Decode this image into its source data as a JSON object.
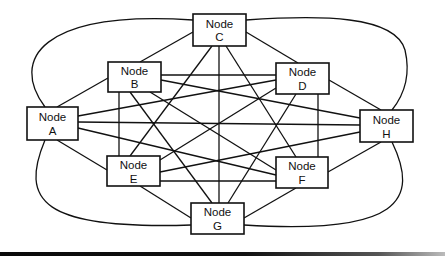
{
  "diagram": {
    "type": "fully-connected-graph",
    "nodes": [
      {
        "id": "A",
        "line1": "Node",
        "line2": "A",
        "x": 27,
        "y": 107,
        "w": 51,
        "h": 33
      },
      {
        "id": "B",
        "line1": "Node",
        "line2": "B",
        "x": 108,
        "y": 62,
        "w": 53,
        "h": 30
      },
      {
        "id": "C",
        "line1": "Node",
        "line2": "C",
        "x": 193,
        "y": 14,
        "w": 53,
        "h": 32
      },
      {
        "id": "D",
        "line1": "Node",
        "line2": "D",
        "x": 276,
        "y": 63,
        "w": 53,
        "h": 31
      },
      {
        "id": "H",
        "line1": "Node",
        "line2": "H",
        "x": 360,
        "y": 110,
        "w": 53,
        "h": 32
      },
      {
        "id": "E",
        "line1": "Node",
        "line2": "E",
        "x": 107,
        "y": 156,
        "w": 53,
        "h": 30
      },
      {
        "id": "F",
        "line1": "Node",
        "line2": "F",
        "x": 276,
        "y": 157,
        "w": 52,
        "h": 31
      },
      {
        "id": "G",
        "line1": "Node",
        "line2": "G",
        "x": 191,
        "y": 203,
        "w": 53,
        "h": 31
      }
    ],
    "edges": [
      [
        "A",
        "B"
      ],
      [
        "A",
        "E"
      ],
      [
        "A",
        "D"
      ],
      [
        "A",
        "H"
      ],
      [
        "A",
        "F"
      ],
      [
        "B",
        "C"
      ],
      [
        "B",
        "D"
      ],
      [
        "B",
        "H"
      ],
      [
        "B",
        "E"
      ],
      [
        "B",
        "G"
      ],
      [
        "B",
        "F"
      ],
      [
        "C",
        "D"
      ],
      [
        "C",
        "E"
      ],
      [
        "C",
        "G"
      ],
      [
        "C",
        "F"
      ],
      [
        "D",
        "H"
      ],
      [
        "D",
        "E"
      ],
      [
        "D",
        "G"
      ],
      [
        "D",
        "F"
      ],
      [
        "H",
        "F"
      ],
      [
        "H",
        "E"
      ],
      [
        "E",
        "F"
      ],
      [
        "E",
        "G"
      ],
      [
        "F",
        "G"
      ]
    ],
    "curved_edges": [
      [
        "A",
        "C"
      ],
      [
        "C",
        "H"
      ],
      [
        "A",
        "G"
      ],
      [
        "H",
        "G"
      ]
    ],
    "line_color": "#111111",
    "node_fill": "#ffffff"
  }
}
